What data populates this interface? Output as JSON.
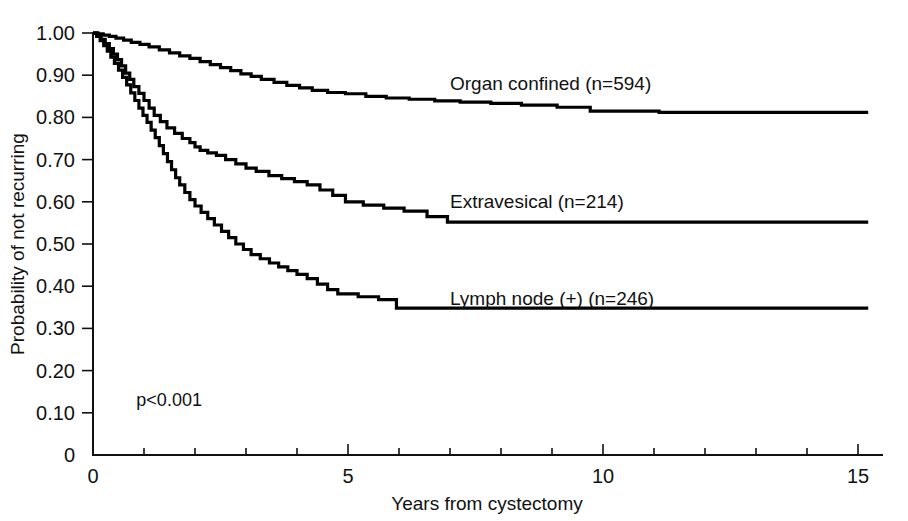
{
  "figure": {
    "width": 908,
    "height": 521,
    "background": "#ffffff",
    "ink_color": "#000000"
  },
  "chart_data": {
    "type": "line",
    "subtype": "kaplan-meier-step",
    "title": "",
    "xlabel": "Years from cystectomy",
    "ylabel": "Probability of not recurring",
    "xlim": [
      0,
      15.3
    ],
    "ylim": [
      0,
      1.0
    ],
    "grid": false,
    "legend_position": "inline-right-of-curves",
    "annotations": [
      {
        "name": "p-value",
        "text": "p<0.001",
        "x": 0.85,
        "y": 0.115
      }
    ],
    "x_ticks_major": [
      0,
      5,
      10,
      15
    ],
    "x_tick_labels": [
      "0",
      "5",
      "10",
      "15"
    ],
    "x_ticks_minor": [
      1,
      2,
      3,
      4,
      6,
      7,
      8,
      9,
      11,
      12,
      13,
      14
    ],
    "y_ticks": [
      0,
      0.1,
      0.2,
      0.3,
      0.4,
      0.5,
      0.6,
      0.7,
      0.8,
      0.9,
      1.0
    ],
    "y_tick_labels": [
      "0",
      "0.10",
      "0.20",
      "0.30",
      "0.40",
      "0.50",
      "0.60",
      "0.70",
      "0.80",
      "0.90",
      "1.00"
    ],
    "series": [
      {
        "name": "Organ confined",
        "n": 594,
        "label": "Organ confined (n=594)",
        "label_x": 7.0,
        "label_y": 0.865,
        "final_value": 0.81,
        "points": [
          [
            0.0,
            1.0
          ],
          [
            0.1,
            0.998
          ],
          [
            0.2,
            0.995
          ],
          [
            0.32,
            0.992
          ],
          [
            0.45,
            0.988
          ],
          [
            0.6,
            0.983
          ],
          [
            0.75,
            0.978
          ],
          [
            0.92,
            0.973
          ],
          [
            1.1,
            0.967
          ],
          [
            1.3,
            0.96
          ],
          [
            1.5,
            0.953
          ],
          [
            1.7,
            0.946
          ],
          [
            1.9,
            0.94
          ],
          [
            2.1,
            0.932
          ],
          [
            2.3,
            0.925
          ],
          [
            2.5,
            0.918
          ],
          [
            2.7,
            0.911
          ],
          [
            2.9,
            0.903
          ],
          [
            3.1,
            0.897
          ],
          [
            3.3,
            0.89
          ],
          [
            3.55,
            0.883
          ],
          [
            3.8,
            0.876
          ],
          [
            4.05,
            0.87
          ],
          [
            4.3,
            0.864
          ],
          [
            4.6,
            0.859
          ],
          [
            4.95,
            0.856
          ],
          [
            5.35,
            0.85
          ],
          [
            5.75,
            0.846
          ],
          [
            6.2,
            0.843
          ],
          [
            6.7,
            0.839
          ],
          [
            7.2,
            0.836
          ],
          [
            7.8,
            0.833
          ],
          [
            8.4,
            0.829
          ],
          [
            9.1,
            0.824
          ],
          [
            9.75,
            0.815
          ],
          [
            11.1,
            0.812
          ],
          [
            15.2,
            0.812
          ]
        ]
      },
      {
        "name": "Extravesical",
        "n": 214,
        "label": "Extravesical (n=214)",
        "label_x": 7.0,
        "label_y": 0.585,
        "final_value": 0.55,
        "points": [
          [
            0.0,
            1.0
          ],
          [
            0.08,
            0.993
          ],
          [
            0.16,
            0.985
          ],
          [
            0.24,
            0.975
          ],
          [
            0.32,
            0.963
          ],
          [
            0.4,
            0.95
          ],
          [
            0.48,
            0.937
          ],
          [
            0.56,
            0.922
          ],
          [
            0.64,
            0.905
          ],
          [
            0.72,
            0.89
          ],
          [
            0.8,
            0.873
          ],
          [
            0.9,
            0.857
          ],
          [
            1.0,
            0.84
          ],
          [
            1.1,
            0.822
          ],
          [
            1.2,
            0.805
          ],
          [
            1.32,
            0.79
          ],
          [
            1.45,
            0.775
          ],
          [
            1.6,
            0.762
          ],
          [
            1.75,
            0.75
          ],
          [
            1.9,
            0.74
          ],
          [
            2.0,
            0.73
          ],
          [
            2.1,
            0.722
          ],
          [
            2.25,
            0.716
          ],
          [
            2.42,
            0.71
          ],
          [
            2.6,
            0.7
          ],
          [
            2.8,
            0.69
          ],
          [
            3.0,
            0.68
          ],
          [
            3.2,
            0.672
          ],
          [
            3.45,
            0.662
          ],
          [
            3.7,
            0.655
          ],
          [
            3.95,
            0.648
          ],
          [
            4.2,
            0.64
          ],
          [
            4.45,
            0.628
          ],
          [
            4.7,
            0.615
          ],
          [
            4.95,
            0.6
          ],
          [
            5.3,
            0.592
          ],
          [
            5.7,
            0.585
          ],
          [
            6.1,
            0.578
          ],
          [
            6.55,
            0.565
          ],
          [
            6.95,
            0.552
          ],
          [
            15.2,
            0.552
          ]
        ]
      },
      {
        "name": "Lymph node (+)",
        "n": 246,
        "label": "Lymph node (+) (n=246)",
        "label_x": 7.0,
        "label_y": 0.355,
        "final_value": 0.335,
        "points": [
          [
            0.0,
            1.0
          ],
          [
            0.07,
            0.992
          ],
          [
            0.14,
            0.982
          ],
          [
            0.21,
            0.97
          ],
          [
            0.28,
            0.957
          ],
          [
            0.35,
            0.943
          ],
          [
            0.42,
            0.928
          ],
          [
            0.5,
            0.912
          ],
          [
            0.58,
            0.895
          ],
          [
            0.66,
            0.877
          ],
          [
            0.74,
            0.858
          ],
          [
            0.82,
            0.84
          ],
          [
            0.9,
            0.822
          ],
          [
            0.98,
            0.805
          ],
          [
            1.06,
            0.788
          ],
          [
            1.14,
            0.77
          ],
          [
            1.22,
            0.752
          ],
          [
            1.3,
            0.733
          ],
          [
            1.38,
            0.714
          ],
          [
            1.46,
            0.695
          ],
          [
            1.54,
            0.676
          ],
          [
            1.62,
            0.657
          ],
          [
            1.7,
            0.64
          ],
          [
            1.8,
            0.622
          ],
          [
            1.9,
            0.605
          ],
          [
            2.0,
            0.59
          ],
          [
            2.12,
            0.575
          ],
          [
            2.25,
            0.56
          ],
          [
            2.38,
            0.545
          ],
          [
            2.52,
            0.53
          ],
          [
            2.66,
            0.515
          ],
          [
            2.8,
            0.5
          ],
          [
            2.95,
            0.487
          ],
          [
            3.1,
            0.475
          ],
          [
            3.28,
            0.465
          ],
          [
            3.46,
            0.455
          ],
          [
            3.64,
            0.446
          ],
          [
            3.82,
            0.437
          ],
          [
            4.0,
            0.428
          ],
          [
            4.2,
            0.418
          ],
          [
            4.4,
            0.405
          ],
          [
            4.6,
            0.392
          ],
          [
            4.8,
            0.382
          ],
          [
            5.2,
            0.375
          ],
          [
            5.6,
            0.368
          ],
          [
            5.95,
            0.348
          ],
          [
            15.2,
            0.348
          ]
        ]
      }
    ]
  },
  "plot_geometry": {
    "left": 93,
    "right": 882,
    "top": 33,
    "bottom": 455,
    "major_tick_len": 11,
    "minor_tick_len": 7,
    "y_tick_len": 11
  }
}
